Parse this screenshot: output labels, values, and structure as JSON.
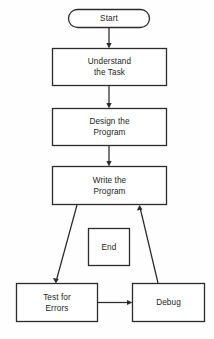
{
  "diagram": {
    "type": "flowchart",
    "orientation": "top-to-bottom",
    "background_color": "#fefefe",
    "line_color": "#2b2b2b",
    "text_color": "#1d1d1d",
    "nodes": [
      {
        "id": "start",
        "label": "Start",
        "lines": [
          "Start"
        ],
        "shape": "stadium",
        "x": 68,
        "y": 9,
        "width": 82,
        "height": 19
      },
      {
        "id": "understand",
        "label": "Understand the Task",
        "lines": [
          "Understand",
          "the Task"
        ],
        "shape": "rectangle",
        "x": 52,
        "y": 48,
        "width": 115,
        "height": 38
      },
      {
        "id": "design",
        "label": "Design the Program",
        "lines": [
          "Design the",
          "Program"
        ],
        "shape": "rectangle",
        "x": 52,
        "y": 108,
        "width": 115,
        "height": 38
      },
      {
        "id": "write",
        "label": "Write the Program",
        "lines": [
          "Write the",
          "Program"
        ],
        "shape": "rectangle",
        "x": 52,
        "y": 166,
        "width": 115,
        "height": 39
      },
      {
        "id": "end",
        "label": "End",
        "lines": [
          "End"
        ],
        "shape": "rectangle",
        "x": 88,
        "y": 228,
        "width": 42,
        "height": 38
      },
      {
        "id": "test",
        "label": "Test for Errors",
        "lines": [
          "Test for",
          "Errors"
        ],
        "shape": "rectangle",
        "x": 16,
        "y": 283,
        "width": 82,
        "height": 39
      },
      {
        "id": "debug",
        "label": "Debug",
        "lines": [
          "Debug"
        ],
        "shape": "rectangle",
        "x": 132,
        "y": 283,
        "width": 73,
        "height": 39
      }
    ],
    "edges": [
      {
        "id": "start-to-understand",
        "from": "start",
        "to": "understand",
        "style": "vertical-arrow",
        "label": ""
      },
      {
        "id": "understand-to-design",
        "from": "understand",
        "to": "design",
        "style": "vertical-arrow",
        "label": ""
      },
      {
        "id": "design-to-write",
        "from": "design",
        "to": "write",
        "style": "vertical-arrow",
        "label": ""
      },
      {
        "id": "write-to-test",
        "from": "write",
        "to": "test",
        "style": "diagonal-arrow",
        "label": ""
      },
      {
        "id": "test-to-debug",
        "from": "test",
        "to": "debug",
        "style": "horizontal-arrow",
        "label": ""
      },
      {
        "id": "debug-to-write",
        "from": "debug",
        "to": "write",
        "style": "diagonal-arrow",
        "label": ""
      }
    ]
  }
}
